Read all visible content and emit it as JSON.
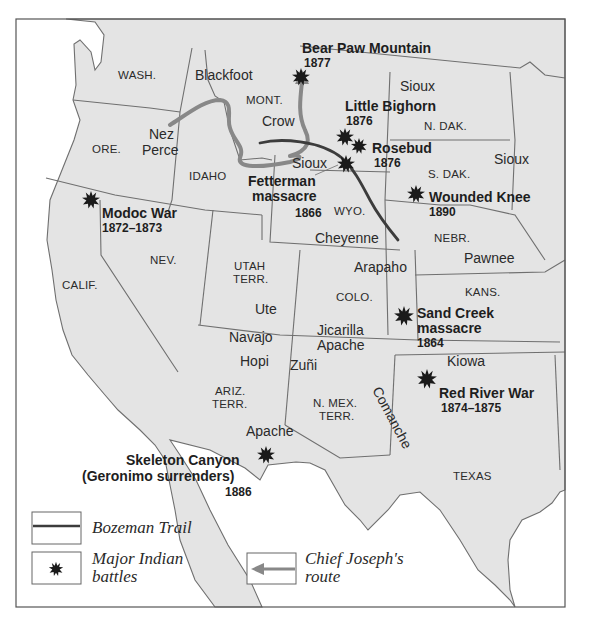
{
  "colors": {
    "land": "#e4e4e4",
    "water": "#ffffff",
    "border": "#6f6f6f",
    "bozeman_trail": "#3c3c3c",
    "chief_joseph_route": "#8a8a8a",
    "battle_marker": "#1a1a1a"
  },
  "states": [
    {
      "id": "wash",
      "label": "WASH."
    },
    {
      "id": "ore",
      "label": "ORE."
    },
    {
      "id": "idaho",
      "label": "IDAHO"
    },
    {
      "id": "mont",
      "label": "MONT."
    },
    {
      "id": "wyo",
      "label": "WYO."
    },
    {
      "id": "ndak",
      "label": "N. DAK."
    },
    {
      "id": "sdak",
      "label": "S. DAK."
    },
    {
      "id": "nebr",
      "label": "NEBR."
    },
    {
      "id": "calif",
      "label": "CALIF."
    },
    {
      "id": "nev",
      "label": "NEV."
    },
    {
      "id": "utah1",
      "label": "UTAH"
    },
    {
      "id": "utah2",
      "label": "TERR."
    },
    {
      "id": "colo",
      "label": "COLO."
    },
    {
      "id": "kans",
      "label": "KANS."
    },
    {
      "id": "ariz1",
      "label": "ARIZ."
    },
    {
      "id": "ariz2",
      "label": "TERR."
    },
    {
      "id": "nmex1",
      "label": "N. MEX."
    },
    {
      "id": "nmex2",
      "label": "TERR."
    },
    {
      "id": "texas",
      "label": "TEXAS"
    }
  ],
  "tribes": [
    {
      "id": "blackfoot",
      "label": "Blackfoot"
    },
    {
      "id": "nez1",
      "label": "Nez"
    },
    {
      "id": "nez2",
      "label": "Perce"
    },
    {
      "id": "crow",
      "label": "Crow"
    },
    {
      "id": "sioux_nd",
      "label": "Sioux"
    },
    {
      "id": "sioux_wy",
      "label": "Sioux"
    },
    {
      "id": "sioux_sd",
      "label": "Sioux"
    },
    {
      "id": "cheyenne",
      "label": "Cheyenne"
    },
    {
      "id": "arapaho",
      "label": "Arapaho"
    },
    {
      "id": "pawnee",
      "label": "Pawnee"
    },
    {
      "id": "ute",
      "label": "Ute"
    },
    {
      "id": "navajo",
      "label": "Navajo"
    },
    {
      "id": "hopi",
      "label": "Hopi"
    },
    {
      "id": "jicarilla1",
      "label": "Jicarilla"
    },
    {
      "id": "jicarilla2",
      "label": "Apache"
    },
    {
      "id": "zuni",
      "label": "Zuñi"
    },
    {
      "id": "kiowa",
      "label": "Kiowa"
    },
    {
      "id": "apache",
      "label": "Apache"
    },
    {
      "id": "comanche",
      "label": "Comanche"
    }
  ],
  "battles": [
    {
      "id": "bear_paw",
      "name": "Bear Paw Mountain",
      "year": "1877"
    },
    {
      "id": "little_bighorn",
      "name": "Little Bighorn",
      "year": "1876"
    },
    {
      "id": "rosebud",
      "name": "Rosebud",
      "year": "1876"
    },
    {
      "id": "fetterman",
      "name": "Fetterman",
      "name2": "massacre",
      "year": "1866"
    },
    {
      "id": "wounded_knee",
      "name": "Wounded Knee",
      "year": "1890"
    },
    {
      "id": "modoc",
      "name": "Modoc War",
      "year": "1872–1873"
    },
    {
      "id": "sand_creek",
      "name": "Sand Creek",
      "name2": "massacre",
      "year": "1864"
    },
    {
      "id": "red_river",
      "name": "Red River War",
      "year": "1874–1875"
    },
    {
      "id": "skeleton",
      "name": "Skeleton Canyon",
      "name2": "(Geronimo surrenders)",
      "year": "1886"
    }
  ],
  "legend": {
    "bozeman": "Bozeman Trail",
    "battles_line1": "Major Indian",
    "battles_line2": "battles",
    "joseph_line1": "Chief Joseph's",
    "joseph_line2": "route"
  }
}
